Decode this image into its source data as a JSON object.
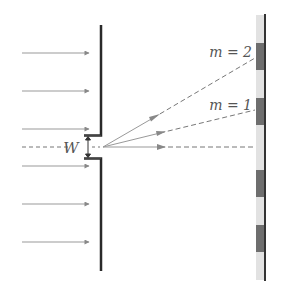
{
  "diagram": {
    "slit_width_label": "W",
    "orders": [
      {
        "label": "m = 2",
        "order": 2
      },
      {
        "label": "m = 1",
        "order": 1
      }
    ],
    "incident_arrows_count": 6,
    "colors": {
      "barrier": "#2a2a2a",
      "arrow": "#888888",
      "dashed_ray": "#777777",
      "screen_strip": "#e0e0e0",
      "screen_line": "#333333",
      "dark_band": "#6e6e6e",
      "text": "#555555"
    }
  }
}
